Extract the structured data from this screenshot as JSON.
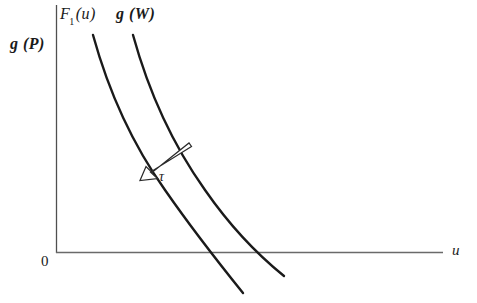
{
  "figure": {
    "title": "",
    "background_color": "#ffffff",
    "ink_color": "#1a1a1a",
    "axis_color": "#555555",
    "axes": {
      "y_axis_label": "g (P)",
      "x_axis_label": "u",
      "origin_label": "0",
      "y_axis": {
        "x": 56,
        "y_top": 5,
        "y_bottom": 253
      },
      "x_axis": {
        "y": 252,
        "x_left": 56,
        "x_right": 443
      }
    },
    "curves": [
      {
        "name": "F1",
        "label": "F",
        "label_subscript": "1",
        "label_suffix": "(u)",
        "label_style": "italic",
        "path": "M 93 35 C 109 93, 133 145, 165 190 C 190 226, 218 262, 243 293"
      },
      {
        "name": "gW",
        "label": "g (W)",
        "label_style": "bold-italic",
        "path": "M 133 35 C 149 93, 173 145, 205 190 C 230 226, 258 255, 284 276"
      }
    ],
    "annotation": {
      "symbol": "τ",
      "name": "tau",
      "description": "open outlined arrow pointing down-left from the g(W) curve toward the F1(u) curve",
      "arrow": {
        "tail_x": 190,
        "tail_y": 148,
        "head_x": 139,
        "head_y": 180
      }
    }
  },
  "chart_data": {
    "type": "line",
    "title": "",
    "xlabel": "u",
    "ylabel": "g (P)",
    "grid": false,
    "legend": "inline-curve-labels",
    "xlim": [
      0,
      1
    ],
    "ylim": [
      0,
      1
    ],
    "annotations": [
      {
        "text": "τ",
        "x": 0.27,
        "y": 0.31,
        "type": "arrow",
        "from": [
          0.35,
          0.42
        ],
        "to": [
          0.21,
          0.29
        ],
        "meaning": "leftward shift of the curve by tau"
      },
      {
        "text": "0",
        "x": 0.0,
        "y": 0.0,
        "type": "origin-label"
      }
    ],
    "series": [
      {
        "name": "F1(u)",
        "label": "F₁(u)",
        "x": [
          0.095,
          0.14,
          0.2,
          0.28,
          0.37,
          0.45,
          0.53,
          0.61
        ],
        "y": [
          1.0,
          0.82,
          0.65,
          0.48,
          0.33,
          0.22,
          0.1,
          -0.04
        ]
      },
      {
        "name": "g(W)",
        "label": "g(W)",
        "x": [
          0.2,
          0.245,
          0.305,
          0.385,
          0.475,
          0.555,
          0.625,
          0.695
        ],
        "y": [
          1.0,
          0.82,
          0.65,
          0.48,
          0.33,
          0.22,
          0.1,
          -0.02
        ]
      }
    ]
  }
}
